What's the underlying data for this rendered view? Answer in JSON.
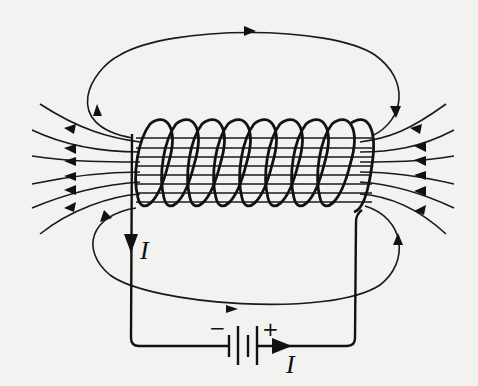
{
  "figure": {
    "labels": {
      "current_left": "I",
      "current_bottom": "I",
      "battery_negative": "−",
      "battery_positive": "+"
    },
    "components": {
      "solenoid_turns": 9,
      "battery_cells": 2,
      "field_lines_left": 7,
      "field_lines_right": 7,
      "field_lines_through_coil": 8,
      "closed_field_loops": 2
    },
    "directions": {
      "field_inside_coil": "leftward",
      "current_left_wire": "downward",
      "current_bottom_wire": "rightward",
      "top_loop": "clockwise",
      "bottom_loop": "counter-clockwise"
    },
    "colors": {
      "ink": "#111111",
      "background": "#f2f2f0"
    }
  }
}
